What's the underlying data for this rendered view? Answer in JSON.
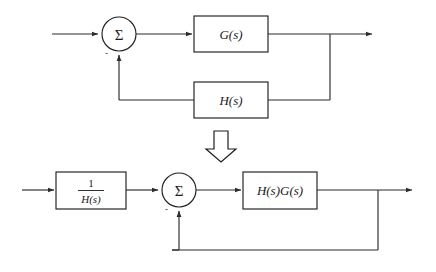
{
  "figure": {
    "background_color": "#ffffff",
    "line_color": "#2b2b2b",
    "box_fill": "#ffffff",
    "box_stroke": "#1f1f1f",
    "text_color": "#1a1a1a"
  },
  "top_diagram": {
    "name": "original-feedback-system",
    "input_arrow": {
      "label": ""
    },
    "summing_junction": {
      "symbol": "Σ",
      "feedback_sign": "-",
      "positive_sign": ""
    },
    "forward_block": {
      "label": "G(s)"
    },
    "feedback_block": {
      "label": "H(s)"
    },
    "output_arrow": {
      "label": ""
    }
  },
  "transition": {
    "name": "equivalence-arrow",
    "direction": "down",
    "glyph": "⇓"
  },
  "bottom_diagram": {
    "name": "reduced-feedback-system",
    "input_arrow": {
      "label": ""
    },
    "prefilter_block": {
      "numerator": "1",
      "denominator": "H(s)",
      "label": "1/H(s)"
    },
    "summing_junction": {
      "symbol": "Σ",
      "feedback_sign": "-",
      "positive_sign": ""
    },
    "forward_block": {
      "label": "H(s)G(s)"
    },
    "output_arrow": {
      "label": ""
    },
    "feedback_path": {
      "label": ""
    }
  }
}
